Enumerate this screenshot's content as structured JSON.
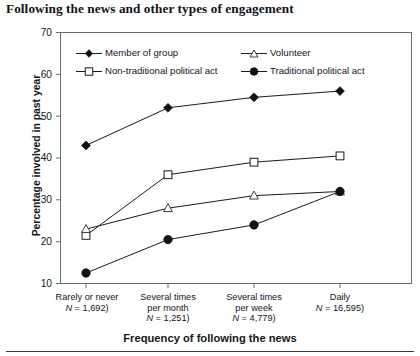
{
  "chart_data": {
    "type": "line",
    "title": "Following the news and other types of engagement",
    "xlabel": "Frequency of following the news",
    "ylabel": "Percentage involved in past year",
    "categories": [
      "Rarely or never",
      "Several times per month",
      "Several times per week",
      "Daily"
    ],
    "category_lines": [
      [
        "Rarely or never",
        "(N = 1,692)"
      ],
      [
        "Several times",
        "per month",
        "(N = 1,251)"
      ],
      [
        "Several times",
        "per week",
        "(N = 4,779)"
      ],
      [
        "Daily",
        "(N = 16,595)"
      ]
    ],
    "category_n": [
      1692,
      1251,
      4779,
      16595
    ],
    "series": [
      {
        "name": "Member of group",
        "marker": "filled-diamond",
        "values": [
          43,
          52,
          54.5,
          56
        ]
      },
      {
        "name": "Non-traditional political act",
        "marker": "open-square",
        "values": [
          21.5,
          36,
          39,
          40.5
        ]
      },
      {
        "name": "Volunteer",
        "marker": "open-triangle",
        "values": [
          23,
          28,
          31,
          32
        ]
      },
      {
        "name": "Traditional political act",
        "marker": "filled-circle",
        "values": [
          12.5,
          20.5,
          24,
          32
        ]
      }
    ],
    "ylim": [
      10,
      70
    ],
    "yticks": [
      10,
      20,
      30,
      40,
      50,
      60,
      70
    ],
    "grid": false,
    "legend_position": "top-inside",
    "line_color": "#1a1a22"
  },
  "legend": {
    "entries": [
      {
        "label": "Member of group",
        "marker": "filled-diamond"
      },
      {
        "label": "Volunteer",
        "marker": "open-triangle"
      },
      {
        "label": "Non-traditional political act",
        "marker": "open-square"
      },
      {
        "label": "Traditional political act",
        "marker": "filled-circle"
      }
    ]
  }
}
